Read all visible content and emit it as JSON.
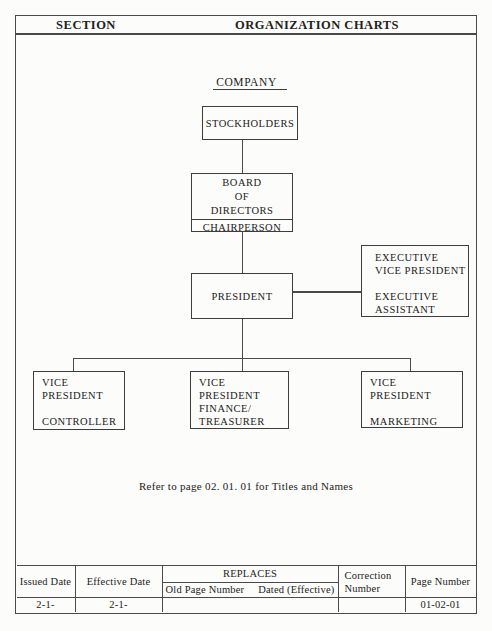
{
  "header": {
    "section_label": "SECTION",
    "title": "ORGANIZATION CHARTS"
  },
  "chart": {
    "title": "COMPANY",
    "nodes": {
      "stockholders": {
        "label": "STOCKHOLDERS"
      },
      "board": {
        "top_lines": [
          "BOARD",
          "OF",
          "DIRECTORS"
        ],
        "bottom_line": "CHAIRPERSON"
      },
      "president": {
        "label": "PRESIDENT"
      },
      "executive": {
        "lines": [
          "EXECUTIVE",
          "VICE PRESIDENT",
          "",
          "EXECUTIVE",
          "ASSISTANT"
        ]
      },
      "vp_controller": {
        "lines": [
          "VICE",
          "PRESIDENT",
          "",
          "CONTROLLER"
        ]
      },
      "vp_finance": {
        "lines": [
          "VICE",
          "PRESIDENT",
          "FINANCE/",
          "TREASURER"
        ]
      },
      "vp_marketing": {
        "lines": [
          "VICE",
          "PRESIDENT",
          "",
          "MARKETING"
        ]
      }
    },
    "note": "Refer to page 02. 01. 01 for Titles and Names"
  },
  "footer": {
    "issued_date": {
      "label": "Issued Date",
      "value": "2-1-"
    },
    "effective_date": {
      "label": "Effective Date",
      "value": "2-1-"
    },
    "replaces": {
      "label": "REPLACES",
      "sub_left": "Old Page Number",
      "sub_right": "Dated (Effective)",
      "value": ""
    },
    "correction": {
      "label_lines": [
        "Correction",
        "Number"
      ],
      "value": ""
    },
    "page_number": {
      "label": "Page Number",
      "value": "01-02-01"
    }
  },
  "colors": {
    "paper": "#fcfcfa",
    "ink": "#222222",
    "line": "#4a4a4a"
  }
}
